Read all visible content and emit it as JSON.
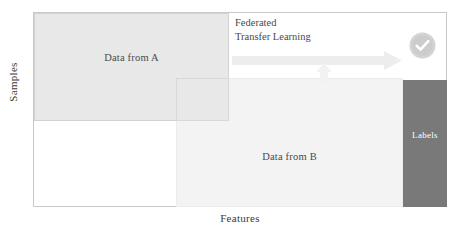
{
  "diagram": {
    "title_hidden": "",
    "axes": {
      "y_label": "Samples",
      "x_label": "Features"
    },
    "blocks": {
      "a": {
        "label": "Data from A",
        "color": "#e8e8e8"
      },
      "b": {
        "label": "Data from B",
        "color": "#f3f3f3"
      },
      "labels": {
        "label": "Labels",
        "color": "#797979",
        "text_color": "#ffffff"
      },
      "overlap": {
        "label": "",
        "color": "#dcdcdc"
      }
    },
    "caption": {
      "line1": "Federated",
      "line2": "Transfer Learning"
    },
    "icons": {
      "transfer_arrow": "right-arrow-icon",
      "align_arrow": "up-arrow-icon",
      "status": "check-circle-icon"
    }
  }
}
